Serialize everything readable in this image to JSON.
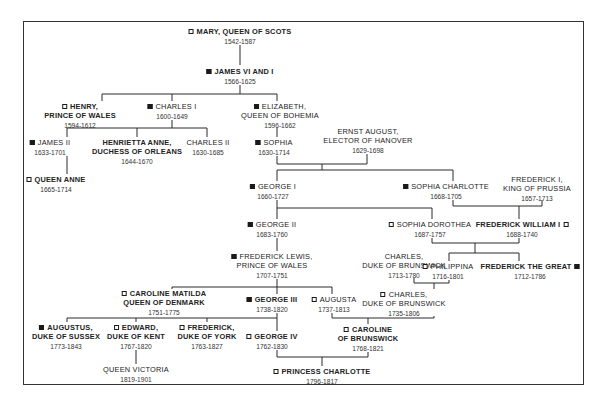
{
  "diagram": {
    "type": "family-tree",
    "legend": {
      "filled_square": "filled-marker",
      "open_square": "open-marker"
    },
    "people": [
      {
        "id": "mary",
        "lines": [
          "MARY, QUEEN OF SCOTS"
        ],
        "dates": "1542-1587",
        "marker": "open",
        "marker_pos": "before",
        "bold": true
      },
      {
        "id": "james6",
        "lines": [
          "JAMES VI AND I"
        ],
        "dates": "1566-1625",
        "marker": "filled",
        "marker_pos": "before",
        "bold": true
      },
      {
        "id": "henry",
        "lines": [
          "HENRY,",
          "PRINCE OF WALES"
        ],
        "dates": "1594-1612",
        "marker": "open",
        "marker_pos": "before",
        "bold": true
      },
      {
        "id": "charles1",
        "lines": [
          "CHARLES I"
        ],
        "dates": "1600-1649",
        "marker": "filled",
        "marker_pos": "before",
        "bold": false
      },
      {
        "id": "elizabeth",
        "lines": [
          "ELIZABETH,",
          "QUEEN OF BOHEMIA"
        ],
        "dates": "1596-1662",
        "marker": "filled",
        "marker_pos": "before",
        "bold": false
      },
      {
        "id": "james2",
        "lines": [
          "JAMES II"
        ],
        "dates": "1633-1701",
        "marker": "filled",
        "marker_pos": "before",
        "bold": false
      },
      {
        "id": "henrietta",
        "lines": [
          "HENRIETTA ANNE,",
          "DUCHESS OF ORLEANS"
        ],
        "dates": "1644-1670",
        "marker": "none",
        "marker_pos": "",
        "bold": true
      },
      {
        "id": "charles2",
        "lines": [
          "CHARLES II"
        ],
        "dates": "1630-1685",
        "marker": "none",
        "marker_pos": "",
        "bold": false
      },
      {
        "id": "sophia",
        "lines": [
          "SOPHIA"
        ],
        "dates": "1630-1714",
        "marker": "filled",
        "marker_pos": "before",
        "bold": false
      },
      {
        "id": "ernst",
        "lines": [
          "ERNST AUGUST,",
          "ELECTOR OF HANOVER"
        ],
        "dates": "1629-1698",
        "marker": "none",
        "marker_pos": "",
        "bold": false
      },
      {
        "id": "anne",
        "lines": [
          "QUEEN ANNE"
        ],
        "dates": "1665-1714",
        "marker": "open",
        "marker_pos": "before",
        "bold": true
      },
      {
        "id": "george1",
        "lines": [
          "GEORGE I"
        ],
        "dates": "1660-1727",
        "marker": "filled",
        "marker_pos": "before",
        "bold": false
      },
      {
        "id": "sophiacharlotte",
        "lines": [
          "SOPHIA CHARLOTTE"
        ],
        "dates": "1668-1705",
        "marker": "filled",
        "marker_pos": "before",
        "bold": false
      },
      {
        "id": "frederick1",
        "lines": [
          "FREDERICK I,",
          "KING OF PRUSSIA"
        ],
        "dates": "1657-1713",
        "marker": "none",
        "marker_pos": "",
        "bold": false
      },
      {
        "id": "george2",
        "lines": [
          "GEORGE II"
        ],
        "dates": "1683-1760",
        "marker": "filled",
        "marker_pos": "before",
        "bold": false
      },
      {
        "id": "sophiadorothea",
        "lines": [
          "SOPHIA DOROTHEA"
        ],
        "dates": "1687-1757",
        "marker": "open",
        "marker_pos": "before",
        "bold": false
      },
      {
        "id": "fwilliam1",
        "lines": [
          "FREDERICK WILLIAM I"
        ],
        "dates": "1688-1740",
        "marker": "open",
        "marker_pos": "after",
        "bold": true
      },
      {
        "id": "flewis",
        "lines": [
          "FREDERICK LEWIS,",
          "PRINCE OF WALES"
        ],
        "dates": "1707-1751",
        "marker": "filled",
        "marker_pos": "before",
        "bold": false
      },
      {
        "id": "charlesb1",
        "lines": [
          "CHARLES,",
          "DUKE OF BRUNSWICK"
        ],
        "dates": "1713-1780",
        "marker": "none",
        "marker_pos": "",
        "bold": false
      },
      {
        "id": "philippina",
        "lines": [
          "PHILIPPINA"
        ],
        "dates": "1716-1801",
        "marker": "open",
        "marker_pos": "before",
        "bold": false
      },
      {
        "id": "fgreat",
        "lines": [
          "FREDERICK THE GREAT"
        ],
        "dates": "1712-1786",
        "marker": "filled",
        "marker_pos": "after",
        "bold": true
      },
      {
        "id": "carolinematilda",
        "lines": [
          "CAROLINE MATILDA",
          "QUEEN OF DENMARK"
        ],
        "dates": "1751-1775",
        "marker": "open",
        "marker_pos": "before",
        "bold": true
      },
      {
        "id": "george3",
        "lines": [
          "GEORGE III"
        ],
        "dates": "1738-1820",
        "marker": "filled",
        "marker_pos": "before",
        "bold": true
      },
      {
        "id": "augusta",
        "lines": [
          "AUGUSTA"
        ],
        "dates": "1737-1813",
        "marker": "open",
        "marker_pos": "before",
        "bold": false
      },
      {
        "id": "charlesb2",
        "lines": [
          "CHARLES,",
          "DUKE OF BRUNSWICK"
        ],
        "dates": "1735-1806",
        "marker": "open",
        "marker_pos": "before",
        "bold": false
      },
      {
        "id": "augustus",
        "lines": [
          "AUGUSTUS,",
          "DUKE OF SUSSEX"
        ],
        "dates": "1773-1843",
        "marker": "filled",
        "marker_pos": "before",
        "bold": true
      },
      {
        "id": "edward",
        "lines": [
          "EDWARD,",
          "DUKE OF KENT"
        ],
        "dates": "1767-1820",
        "marker": "open",
        "marker_pos": "before",
        "bold": true
      },
      {
        "id": "fyork",
        "lines": [
          "FREDERICK,",
          "DUKE OF YORK"
        ],
        "dates": "1763-1827",
        "marker": "open",
        "marker_pos": "before",
        "bold": true
      },
      {
        "id": "george4",
        "lines": [
          "GEORGE IV"
        ],
        "dates": "1762-1830",
        "marker": "open",
        "marker_pos": "before",
        "bold": true
      },
      {
        "id": "carolineb",
        "lines": [
          "CAROLINE",
          "OF BRUNSWICK"
        ],
        "dates": "1768-1821",
        "marker": "open",
        "marker_pos": "before",
        "bold": true
      },
      {
        "id": "victoria",
        "lines": [
          "QUEEN VICTORIA"
        ],
        "dates": "1819-1901",
        "marker": "none",
        "marker_pos": "",
        "bold": false
      },
      {
        "id": "charlotte",
        "lines": [
          "PRINCESS CHARLOTTE"
        ],
        "dates": "1796-1817",
        "marker": "open",
        "marker_pos": "before",
        "bold": true
      }
    ]
  }
}
